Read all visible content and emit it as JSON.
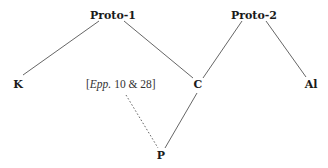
{
  "diagram": {
    "type": "stemma",
    "nodes": [
      {
        "id": "proto1",
        "label": "Proto-1",
        "x": 113,
        "y": 19
      },
      {
        "id": "proto2",
        "label": "Proto-2",
        "x": 254,
        "y": 19
      },
      {
        "id": "K",
        "label": "K",
        "x": 18,
        "y": 88
      },
      {
        "id": "C",
        "label": "C",
        "x": 198,
        "y": 88
      },
      {
        "id": "Al",
        "label": "Al",
        "x": 311,
        "y": 88
      },
      {
        "id": "P",
        "label": "P",
        "x": 161,
        "y": 159
      }
    ],
    "annotation": {
      "open_bracket": "[",
      "italic_part": "Epp.",
      "rest": " 10 & 28]",
      "full_text": "[Epp. 10 & 28]"
    },
    "edges": [
      {
        "from": "proto1",
        "to": "K",
        "style": "solid"
      },
      {
        "from": "proto1",
        "to": "C",
        "style": "solid"
      },
      {
        "from": "proto2",
        "to": "C",
        "style": "solid"
      },
      {
        "from": "proto2",
        "to": "Al",
        "style": "solid"
      },
      {
        "from": "C",
        "to": "P",
        "style": "solid"
      },
      {
        "from": "annotation",
        "to": "P",
        "style": "dotted"
      }
    ]
  }
}
